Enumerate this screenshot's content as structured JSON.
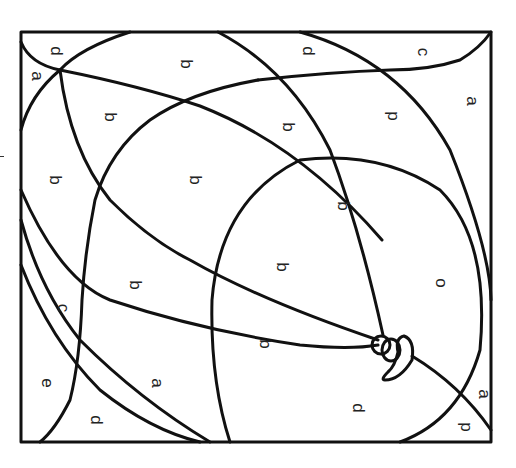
{
  "page": {
    "type": "color-by-letter coloring page",
    "stroke_color": "#111111",
    "background": "#ffffff"
  },
  "labels": [
    {
      "text": "d",
      "x": 56,
      "y": 51
    },
    {
      "text": "a",
      "x": 37,
      "y": 76
    },
    {
      "text": "b",
      "x": 186,
      "y": 64
    },
    {
      "text": "b",
      "x": 110,
      "y": 117
    },
    {
      "text": "b",
      "x": 55,
      "y": 180
    },
    {
      "text": "b",
      "x": 195,
      "y": 180
    },
    {
      "text": "d",
      "x": 308,
      "y": 51
    },
    {
      "text": "c",
      "x": 423,
      "y": 52
    },
    {
      "text": "a",
      "x": 472,
      "y": 101
    },
    {
      "text": "b",
      "x": 288,
      "y": 127
    },
    {
      "text": "p",
      "x": 393,
      "y": 116
    },
    {
      "text": "b",
      "x": 343,
      "y": 206
    },
    {
      "text": "b",
      "x": 135,
      "y": 285
    },
    {
      "text": "b",
      "x": 282,
      "y": 267
    },
    {
      "text": "c",
      "x": 63,
      "y": 308
    },
    {
      "text": "o",
      "x": 441,
      "y": 283
    },
    {
      "text": "b",
      "x": 265,
      "y": 344
    },
    {
      "text": "e",
      "x": 47,
      "y": 383
    },
    {
      "text": "a",
      "x": 157,
      "y": 383
    },
    {
      "text": "d",
      "x": 96,
      "y": 420
    },
    {
      "text": "d",
      "x": 358,
      "y": 408
    },
    {
      "text": "a",
      "x": 484,
      "y": 394
    },
    {
      "text": "p",
      "x": 466,
      "y": 427
    }
  ]
}
